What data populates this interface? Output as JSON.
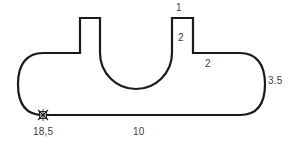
{
  "drawing": {
    "title": "tank-outline-dimension-drawing",
    "stroke_color": "#1a1a1a",
    "fill_color": "#ffffff",
    "text_color": "#3d3d3d",
    "background_color": "#ffffff",
    "labels": {
      "top_tab_width": "1",
      "tab_height": "2",
      "shoulder_depth": "2",
      "right_radius": "3.5",
      "datum": "18,5",
      "bottom_length": "10"
    },
    "marker": {
      "name": "datum-cross-marker",
      "x": 43,
      "y": 115
    },
    "outline": {
      "bottom_line_start_x": 43,
      "bottom_line_end_x": 240,
      "bottom_line_y": 115,
      "left_tab": {
        "left_x": 80,
        "right_x": 100,
        "top_y": 18,
        "base_y": 53
      },
      "right_tab": {
        "left_x": 172,
        "right_x": 193,
        "top_y": 18,
        "base_y": 53
      },
      "notch": {
        "left_x": 100,
        "right_x": 172,
        "bottom_y": 53
      },
      "shoulder_y": 53,
      "body_top_y": 53
    }
  }
}
